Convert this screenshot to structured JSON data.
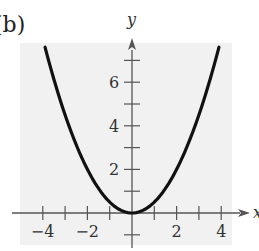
{
  "panel_label": "(b)",
  "chart_data": {
    "type": "line",
    "title": "",
    "function": "y = x^2 / 2",
    "xlabel": "x",
    "ylabel": "y",
    "xlim": [
      -4.5,
      4.5
    ],
    "ylim": [
      -1,
      7.6
    ],
    "x_ticks": [
      -4,
      -3,
      -2,
      -1,
      1,
      2,
      3,
      4
    ],
    "x_tick_labels": [
      "-4",
      "-2",
      "2",
      "4"
    ],
    "y_ticks": [
      -1,
      1,
      2,
      3,
      4,
      5,
      6,
      7
    ],
    "y_tick_labels": [
      "2",
      "4",
      "6"
    ],
    "grid": false,
    "background": "#f1f1f1",
    "series": [
      {
        "name": "parabola",
        "color": "#111111",
        "x": [
          -3.9,
          -3.5,
          -3,
          -2.5,
          -2,
          -1.5,
          -1,
          -0.5,
          0,
          0.5,
          1,
          1.5,
          2,
          2.5,
          3,
          3.5,
          3.9
        ],
        "y": [
          7.6,
          6.125,
          4.5,
          3.125,
          2,
          1.125,
          0.5,
          0.125,
          0,
          0.125,
          0.5,
          1.125,
          2,
          3.125,
          4.5,
          6.125,
          7.6
        ]
      }
    ]
  }
}
